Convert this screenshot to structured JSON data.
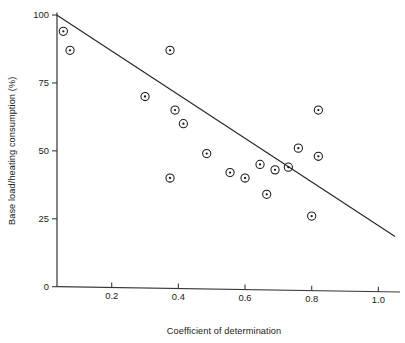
{
  "chart_data": {
    "type": "scatter",
    "title": "",
    "xlabel": "Coefficient of determination",
    "ylabel": "Base load/heating consumption (%)",
    "xlim": [
      0.0,
      1.05
    ],
    "ylim": [
      0,
      100
    ],
    "xticks": [
      0.2,
      0.4,
      0.6,
      0.8,
      1.0
    ],
    "xtick_labels": [
      "0.2",
      "0.4",
      "0.6",
      "0.8",
      "1.0"
    ],
    "yticks": [
      0,
      25,
      50,
      75,
      100
    ],
    "ytick_labels": [
      "0",
      "25",
      "50",
      "75",
      "100"
    ],
    "grid": false,
    "legend": null,
    "marker": "circle-with-center-dot",
    "points": [
      {
        "x": 0.055,
        "y": 94
      },
      {
        "x": 0.075,
        "y": 87
      },
      {
        "x": 0.3,
        "y": 70
      },
      {
        "x": 0.375,
        "y": 87
      },
      {
        "x": 0.39,
        "y": 65
      },
      {
        "x": 0.415,
        "y": 60
      },
      {
        "x": 0.375,
        "y": 40
      },
      {
        "x": 0.485,
        "y": 49
      },
      {
        "x": 0.555,
        "y": 42
      },
      {
        "x": 0.6,
        "y": 40
      },
      {
        "x": 0.645,
        "y": 45
      },
      {
        "x": 0.69,
        "y": 43
      },
      {
        "x": 0.665,
        "y": 34
      },
      {
        "x": 0.73,
        "y": 44
      },
      {
        "x": 0.76,
        "y": 51
      },
      {
        "x": 0.82,
        "y": 65
      },
      {
        "x": 0.82,
        "y": 48
      },
      {
        "x": 0.8,
        "y": 26
      }
    ],
    "trend_line": {
      "x_start": 0.035,
      "y_start": 100,
      "x_end": 1.05,
      "y_end": 18.5
    }
  }
}
